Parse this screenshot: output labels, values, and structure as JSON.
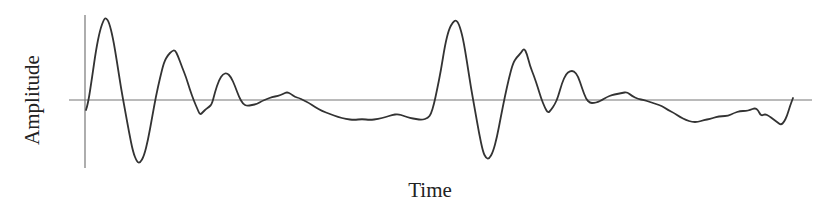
{
  "chart_data": {
    "type": "line",
    "title": "",
    "xlabel": "Time",
    "ylabel": "Amplitude",
    "grid": false,
    "legend": null,
    "axes": {
      "y_axis_x": 85,
      "zero_line_y": 100,
      "zero_line_x_range": [
        69,
        812
      ]
    },
    "series": [
      {
        "name": "waveform",
        "color": "#333333",
        "description": "Two repeated damped oscillation bursts with low-amplitude drift between; no numeric ticks shown",
        "points": [
          [
            86,
            110
          ],
          [
            88,
            104
          ],
          [
            92,
            78
          ],
          [
            96,
            50
          ],
          [
            100,
            30
          ],
          [
            104,
            19
          ],
          [
            106,
            18
          ],
          [
            109,
            22
          ],
          [
            113,
            38
          ],
          [
            117,
            62
          ],
          [
            121,
            88
          ],
          [
            125,
            110
          ],
          [
            129,
            132
          ],
          [
            133,
            152
          ],
          [
            137,
            162
          ],
          [
            140,
            163
          ],
          [
            144,
            156
          ],
          [
            148,
            140
          ],
          [
            152,
            118
          ],
          [
            156,
            96
          ],
          [
            160,
            78
          ],
          [
            164,
            62
          ],
          [
            168,
            55
          ],
          [
            172,
            51
          ],
          [
            175,
            50
          ],
          [
            178,
            56
          ],
          [
            182,
            67
          ],
          [
            186,
            77
          ],
          [
            190,
            90
          ],
          [
            194,
            101
          ],
          [
            197,
            108
          ],
          [
            200,
            115
          ],
          [
            203,
            112
          ],
          [
            206,
            109
          ],
          [
            209,
            107
          ],
          [
            212,
            104
          ],
          [
            215,
            92
          ],
          [
            219,
            80
          ],
          [
            223,
            74
          ],
          [
            227,
            73
          ],
          [
            231,
            77
          ],
          [
            235,
            86
          ],
          [
            239,
            97
          ],
          [
            243,
            104
          ],
          [
            247,
            106
          ],
          [
            252,
            105
          ],
          [
            257,
            104
          ],
          [
            262,
            101
          ],
          [
            267,
            99
          ],
          [
            272,
            97
          ],
          [
            278,
            96
          ],
          [
            283,
            94
          ],
          [
            287,
            92
          ],
          [
            291,
            94
          ],
          [
            295,
            97
          ],
          [
            299,
            98
          ],
          [
            303,
            100
          ],
          [
            309,
            103
          ],
          [
            315,
            107
          ],
          [
            322,
            111
          ],
          [
            330,
            114
          ],
          [
            338,
            117
          ],
          [
            346,
            119
          ],
          [
            354,
            120
          ],
          [
            362,
            119
          ],
          [
            370,
            120
          ],
          [
            378,
            119
          ],
          [
            386,
            117
          ],
          [
            392,
            115
          ],
          [
            398,
            114
          ],
          [
            404,
            116
          ],
          [
            410,
            118
          ],
          [
            416,
            119
          ],
          [
            422,
            120
          ],
          [
            428,
            118
          ],
          [
            431,
            114
          ],
          [
            434,
            104
          ],
          [
            437,
            90
          ],
          [
            441,
            70
          ],
          [
            445,
            45
          ],
          [
            449,
            29
          ],
          [
            453,
            22
          ],
          [
            456,
            20
          ],
          [
            459,
            24
          ],
          [
            463,
            38
          ],
          [
            467,
            62
          ],
          [
            471,
            88
          ],
          [
            475,
            110
          ],
          [
            479,
            133
          ],
          [
            483,
            152
          ],
          [
            486,
            158
          ],
          [
            489,
            159
          ],
          [
            493,
            152
          ],
          [
            497,
            137
          ],
          [
            501,
            116
          ],
          [
            505,
            96
          ],
          [
            509,
            78
          ],
          [
            513,
            63
          ],
          [
            517,
            57
          ],
          [
            521,
            53
          ],
          [
            524,
            48
          ],
          [
            527,
            54
          ],
          [
            530,
            66
          ],
          [
            534,
            76
          ],
          [
            538,
            88
          ],
          [
            541,
            98
          ],
          [
            545,
            108
          ],
          [
            548,
            113
          ],
          [
            551,
            110
          ],
          [
            555,
            104
          ],
          [
            558,
            97
          ],
          [
            562,
            83
          ],
          [
            566,
            74
          ],
          [
            570,
            71
          ],
          [
            574,
            71
          ],
          [
            578,
            76
          ],
          [
            582,
            88
          ],
          [
            586,
            99
          ],
          [
            590,
            103
          ],
          [
            594,
            103
          ],
          [
            598,
            102
          ],
          [
            602,
            100
          ],
          [
            607,
            97
          ],
          [
            612,
            95
          ],
          [
            617,
            94
          ],
          [
            622,
            93
          ],
          [
            627,
            92
          ],
          [
            632,
            96
          ],
          [
            638,
            99
          ],
          [
            644,
            100
          ],
          [
            650,
            102
          ],
          [
            656,
            104
          ],
          [
            662,
            106
          ],
          [
            668,
            110
          ],
          [
            674,
            113
          ],
          [
            680,
            117
          ],
          [
            686,
            120
          ],
          [
            692,
            122
          ],
          [
            698,
            122
          ],
          [
            704,
            120
          ],
          [
            710,
            119
          ],
          [
            716,
            117
          ],
          [
            722,
            116
          ],
          [
            728,
            116
          ],
          [
            734,
            113
          ],
          [
            740,
            111
          ],
          [
            746,
            111
          ],
          [
            750,
            110
          ],
          [
            755,
            108
          ],
          [
            758,
            110
          ],
          [
            761,
            116
          ],
          [
            765,
            114
          ],
          [
            769,
            116
          ],
          [
            773,
            119
          ],
          [
            777,
            122
          ],
          [
            781,
            125
          ],
          [
            784,
            122
          ],
          [
            787,
            116
          ],
          [
            790,
            106
          ],
          [
            793,
            98
          ]
        ]
      }
    ]
  }
}
